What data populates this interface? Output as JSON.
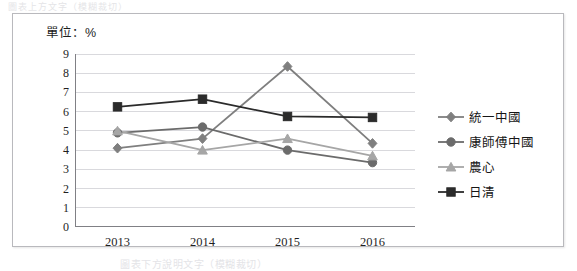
{
  "captions": {
    "top": "圖表上方文字（模糊裁切）",
    "bottom": "圖表下方說明文字（模糊裁切）"
  },
  "unit_label": "單位：%",
  "chart_data": {
    "type": "line",
    "title": "",
    "subtitle": "",
    "xlabel": "",
    "ylabel": "",
    "unit": "單位：%",
    "categories": [
      "2013",
      "2014",
      "2015",
      "2016"
    ],
    "ylim": [
      0,
      9
    ],
    "yticks": [
      0,
      1,
      2,
      3,
      4,
      5,
      6,
      7,
      8,
      9
    ],
    "grid": "horizontal",
    "legend_position": "right",
    "series": [
      {
        "name": "統一中國",
        "marker": "diamond",
        "color": "#7f7f7f",
        "values": [
          4.1,
          4.6,
          8.35,
          4.35
        ]
      },
      {
        "name": "康師傅中國",
        "marker": "circle",
        "color": "#6b6b6b",
        "values": [
          4.9,
          5.2,
          4.0,
          3.35
        ]
      },
      {
        "name": "農心",
        "marker": "triangle",
        "color": "#a6a6a6",
        "values": [
          5.0,
          4.0,
          4.6,
          3.7
        ]
      },
      {
        "name": "日清",
        "marker": "square",
        "color": "#2b2b2b",
        "values": [
          6.25,
          6.65,
          5.75,
          5.7
        ]
      }
    ]
  },
  "colors": {
    "frame_border": "#b9b9bd",
    "gridline": "#d9d9dd",
    "axis": "#808085",
    "text": "#1f1f1f",
    "background": "#ffffff"
  }
}
